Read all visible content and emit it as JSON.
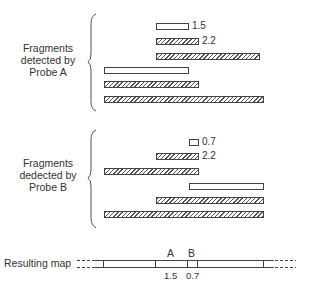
{
  "probe_a": {
    "label_lines": [
      "Fragments",
      "detected by",
      "Probe A"
    ],
    "fragments": [
      {
        "x": 156,
        "y": 23,
        "w": 33,
        "style": "open",
        "size_label": "1.5"
      },
      {
        "x": 156,
        "y": 38,
        "w": 43,
        "style": "hatched",
        "size_label": "2.2"
      },
      {
        "x": 156,
        "y": 53,
        "w": 104,
        "style": "hatched",
        "size_label": ""
      },
      {
        "x": 104,
        "y": 67,
        "w": 85,
        "style": "open",
        "size_label": ""
      },
      {
        "x": 104,
        "y": 81,
        "w": 95,
        "style": "hatched",
        "size_label": ""
      },
      {
        "x": 104,
        "y": 96,
        "w": 160,
        "style": "hatched",
        "size_label": ""
      }
    ]
  },
  "probe_b": {
    "label_lines": [
      "Fragments",
      "dedected by",
      "Probe B"
    ],
    "fragments": [
      {
        "x": 189,
        "y": 139,
        "w": 10,
        "style": "open",
        "size_label": "0.7"
      },
      {
        "x": 156,
        "y": 153,
        "w": 43,
        "style": "hatched",
        "size_label": "2.2"
      },
      {
        "x": 104,
        "y": 168,
        "w": 95,
        "style": "hatched",
        "size_label": ""
      },
      {
        "x": 189,
        "y": 183,
        "w": 75,
        "style": "open",
        "size_label": ""
      },
      {
        "x": 156,
        "y": 197,
        "w": 108,
        "style": "hatched",
        "size_label": ""
      },
      {
        "x": 104,
        "y": 211,
        "w": 160,
        "style": "hatched",
        "size_label": ""
      }
    ]
  },
  "map": {
    "label": "Resulting map",
    "site_labels": [
      {
        "text": "A",
        "x": 171
      },
      {
        "text": "B",
        "x": 192
      }
    ],
    "segment_labels": [
      {
        "text": "1.5",
        "x": 171
      },
      {
        "text": "0.7",
        "x": 192
      }
    ],
    "ticks_x": [
      103,
      155,
      188,
      197,
      263
    ]
  }
}
